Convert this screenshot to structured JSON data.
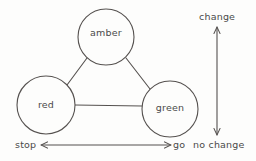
{
  "diagram": {
    "type": "state-transition-triangle",
    "background_color": "#fdfdfc",
    "stroke_color": "#55514f",
    "text_color": "#4a4a4a",
    "nodes": [
      {
        "id": "amber",
        "label": "amber",
        "cx": 106,
        "cy": 37,
        "r": 28
      },
      {
        "id": "red",
        "label": "red",
        "cx": 46,
        "cy": 105,
        "r": 29
      },
      {
        "id": "green",
        "label": "green",
        "cx": 170,
        "cy": 109,
        "r": 28
      }
    ],
    "edges": [
      {
        "from": "amber",
        "to": "red",
        "x1": 87,
        "y1": 58,
        "x2": 67,
        "y2": 85
      },
      {
        "from": "amber",
        "to": "green",
        "x1": 126,
        "y1": 58,
        "x2": 150,
        "y2": 89
      },
      {
        "from": "red",
        "to": "green",
        "x1": 75,
        "y1": 105,
        "x2": 142,
        "y2": 106
      }
    ],
    "axes": {
      "horizontal": {
        "name": "stop-go-axis",
        "left_label": "stop",
        "right_label": "go",
        "x1": 40,
        "x2": 172,
        "y": 145,
        "double_headed": true
      },
      "vertical": {
        "name": "change-axis",
        "top_label": "change",
        "bottom_label": "no change",
        "x": 217,
        "y1": 26,
        "y2": 136,
        "double_headed": true
      }
    }
  }
}
